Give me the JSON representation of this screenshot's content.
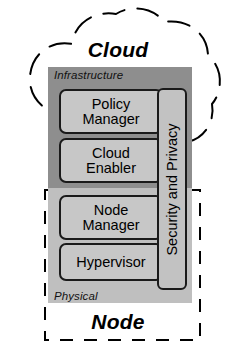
{
  "diagram": {
    "title_cloud": "Cloud",
    "title_node": "Node",
    "layers": {
      "infrastructure_label": "Infrastructure",
      "physical_label": "Physical"
    },
    "components": [
      {
        "id": "policy-manager",
        "line1": "Policy",
        "line2": "Manager"
      },
      {
        "id": "cloud-enabler",
        "line1": "Cloud",
        "line2": "Enabler"
      },
      {
        "id": "node-manager",
        "line1": "Node",
        "line2": "Manager"
      },
      {
        "id": "hypervisor",
        "line1": "Hypervisor",
        "line2": ""
      }
    ],
    "cross_cutting": {
      "id": "security-and-privacy",
      "label": "Security and Privacy"
    },
    "boundaries": [
      {
        "id": "cloud-boundary",
        "style": "dashed-cloud"
      },
      {
        "id": "node-boundary",
        "style": "dashed-rectangle"
      }
    ],
    "colors": {
      "infrastructure_band": "#8e8e8e",
      "physical_band": "#bfbfbf",
      "component_fill": "#c7c7c7",
      "security_fill": "#c2c2c2",
      "stroke": "#1a1a1a",
      "text": "#000000",
      "background": "#ffffff"
    }
  }
}
